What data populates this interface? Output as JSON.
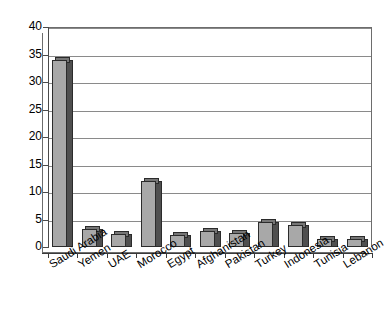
{
  "chart_data": {
    "type": "bar",
    "title": "",
    "subtitle": "",
    "xlabel": "",
    "ylabel": "",
    "ylim": [
      0,
      40
    ],
    "ytick_step": 5,
    "yticks": [
      0,
      5,
      10,
      15,
      20,
      25,
      30,
      35,
      40
    ],
    "grid": true,
    "legend": false,
    "legend_position": "none",
    "categories": [
      "Saudi Arabia",
      "Yemen",
      "UAE",
      "Morocco",
      "Egypt",
      "Afghanistan",
      "Pakistan",
      "Turkey",
      "Indonesia",
      "Tunisia",
      "Lebanon"
    ],
    "values": [
      34,
      3.3,
      2.3,
      12,
      2.2,
      3,
      2.5,
      4.6,
      4,
      1.5,
      1.4
    ],
    "series": [
      {
        "name": "Count",
        "values": [
          34,
          3.3,
          2.3,
          12,
          2.2,
          3,
          2.5,
          4.6,
          4,
          1.5,
          1.4
        ]
      }
    ],
    "style": {
      "bar_face_color": "#a8a8a8",
      "bar_side_color": "#4f4f4f",
      "bar_top_color": "#767676",
      "bar_edge_color": "#2b2b2b",
      "gridline_color": "#8a8a8a",
      "axis_color": "#3a3a3a",
      "background_color": "#ffffff",
      "three_d": true
    }
  }
}
